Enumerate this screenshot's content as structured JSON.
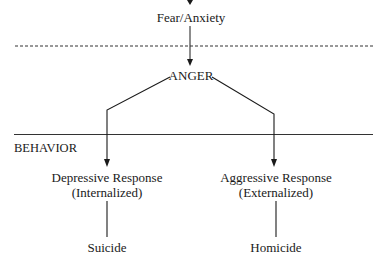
{
  "diagram": {
    "nodes": {
      "fear": "Fear/Anxiety",
      "anger": "ANGER",
      "depressive_line1": "Depressive Response",
      "depressive_line2": "(Internalized)",
      "aggressive_line1": "Aggressive Response",
      "aggressive_line2": "(Externalized)",
      "suicide": "Suicide",
      "homicide": "Homicide"
    },
    "section_label": "BEHAVIOR",
    "edges": [
      {
        "from": "top",
        "to": "fear",
        "type": "arrow"
      },
      {
        "from": "fear",
        "to": "anger",
        "type": "arrow"
      },
      {
        "from": "anger",
        "to": "depressive",
        "type": "arrow"
      },
      {
        "from": "anger",
        "to": "aggressive",
        "type": "arrow"
      },
      {
        "from": "depressive",
        "to": "suicide",
        "type": "line"
      },
      {
        "from": "aggressive",
        "to": "homicide",
        "type": "line"
      }
    ],
    "dividers": [
      {
        "style": "dashed",
        "position": "between fear and anger"
      },
      {
        "style": "solid",
        "position": "above behavior"
      }
    ]
  }
}
